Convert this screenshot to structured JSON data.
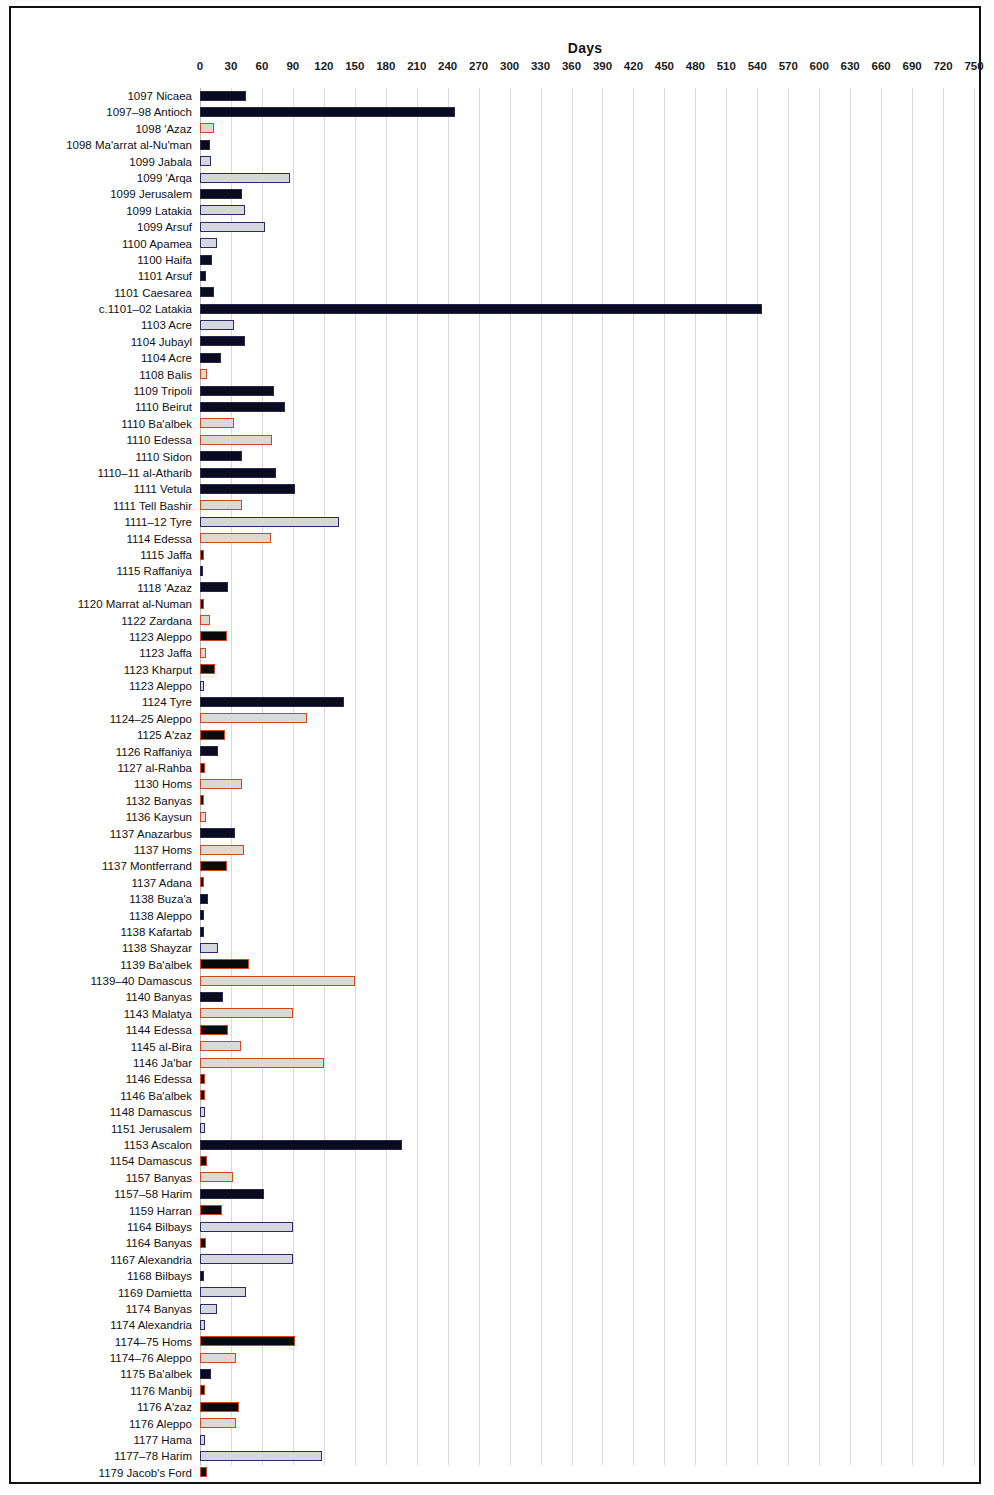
{
  "chart_data": {
    "type": "bar",
    "orientation": "horizontal",
    "title": "Days",
    "xlabel": "Days",
    "ylabel": "",
    "xlim": [
      0,
      750
    ],
    "xticks": [
      0,
      30,
      60,
      90,
      120,
      150,
      180,
      210,
      240,
      270,
      300,
      330,
      360,
      390,
      420,
      450,
      480,
      510,
      540,
      570,
      600,
      630,
      660,
      690,
      720,
      750
    ],
    "grid": true,
    "legend": "none",
    "styles": {
      "s-dark": {
        "fill": "#0b0b1f",
        "edge": "#272750"
      },
      "s-light": {
        "fill": "#d6d6de",
        "edge": "#2b2b63"
      },
      "s-lightred": {
        "fill": "#dcd9d2",
        "edge": "#d1471f"
      },
      "s-darkred": {
        "fill": "#0a0a0a",
        "edge": "#d1471f"
      }
    },
    "categories": [
      "1097 Nicaea",
      "1097–98 Antioch",
      "1098 'Azaz",
      "1098 Ma'arrat al-Nu'man",
      "1099 Jabala",
      "1099 'Arqa",
      "1099 Jerusalem",
      "1099 Latakia",
      "1099 Arsuf",
      "1100 Apamea",
      "1100 Haifa",
      "1101 Arsuf",
      "1101 Caesarea",
      "c.1101–02 Latakia",
      "1103 Acre",
      "1104 Jubayl",
      "1104 Acre",
      "1108 Balis",
      "1109 Tripoli",
      "1110 Beirut",
      "1110 Ba'albek",
      "1110 Edessa",
      "1110 Sidon",
      "1110–11 al-Atharib",
      "1111 Vetula",
      "1111 Tell Bashir",
      "1111–12 Tyre",
      "1114 Edessa",
      "1115 Jaffa",
      "1115 Raffaniya",
      "1118 'Azaz",
      "1120 Marrat al-Numan",
      "1122 Zardana",
      "1123 Aleppo",
      "1123 Jaffa",
      "1123 Kharput",
      "1123 Aleppo",
      "1124 Tyre",
      "1124–25 Aleppo",
      "1125 A'zaz",
      "1126 Raffaniya",
      "1127 al-Rahba",
      "1130 Homs",
      "1132 Banyas",
      "1136 Kaysun",
      "1137 Anazarbus",
      "1137 Homs",
      "1137 Montferrand",
      "1137 Adana",
      "1138 Buza'a",
      "1138 Aleppo",
      "1138 Kafartab",
      "1138 Shayzar",
      "1139 Ba'albek",
      "1139–40 Damascus",
      "1140 Banyas",
      "1143 Malatya",
      "1144 Edessa",
      "1145 al-Bira",
      "1146 Ja'bar",
      "1146 Edessa",
      "1146 Ba'albek",
      "1148 Damascus",
      "1151 Jerusalem",
      "1153 Ascalon",
      "1154 Damascus",
      "1157 Banyas",
      "1157–58 Harim",
      "1159 Harran",
      "1164 Bilbays",
      "1164 Banyas",
      "1167 Alexandria",
      "1168 Bilbays",
      "1169 Damietta",
      "1174 Banyas",
      "1174 Alexandria",
      "1174–75 Homs",
      "1174–76 Aleppo",
      "1175 Ba'albek",
      "1176 Manbij",
      "1176 A'zaz",
      "1176 Aleppo",
      "1177 Hama",
      "1177–78 Harim",
      "1179 Jacob's Ford"
    ],
    "values": [
      45,
      247,
      14,
      10,
      11,
      87,
      41,
      44,
      63,
      16,
      12,
      6,
      14,
      545,
      33,
      44,
      20,
      7,
      72,
      82,
      33,
      70,
      41,
      74,
      92,
      41,
      135,
      69,
      4,
      3,
      27,
      4,
      10,
      26,
      6,
      15,
      4,
      140,
      104,
      24,
      17,
      5,
      41,
      4,
      6,
      34,
      43,
      26,
      4,
      8,
      4,
      4,
      17,
      47,
      150,
      22,
      90,
      27,
      40,
      120,
      5,
      5,
      5,
      5,
      196,
      7,
      32,
      62,
      21,
      90,
      6,
      90,
      4,
      45,
      16,
      5,
      92,
      35,
      11,
      5,
      38,
      35,
      5,
      118,
      7
    ],
    "bar_styles": [
      "s-dark",
      "s-dark",
      "s-lightred",
      "s-dark",
      "s-light",
      "s-light",
      "s-dark",
      "s-light",
      "s-light",
      "s-light",
      "s-dark",
      "s-dark",
      "s-dark",
      "s-dark",
      "s-light",
      "s-dark",
      "s-dark",
      "s-lightred",
      "s-dark",
      "s-dark",
      "s-lightred",
      "s-lightred",
      "s-dark",
      "s-dark",
      "s-dark",
      "s-lightred",
      "s-light",
      "s-lightred",
      "s-darkred",
      "s-dark",
      "s-dark",
      "s-darkred",
      "s-lightred",
      "s-darkred",
      "s-lightred",
      "s-darkred",
      "s-light",
      "s-dark",
      "s-lightred",
      "s-darkred",
      "s-dark",
      "s-darkred",
      "s-lightred",
      "s-darkred",
      "s-lightred",
      "s-dark",
      "s-lightred",
      "s-darkred",
      "s-darkred",
      "s-dark",
      "s-dark",
      "s-dark",
      "s-light",
      "s-darkred",
      "s-lightred",
      "s-dark",
      "s-lightred",
      "s-darkred",
      "s-lightred",
      "s-lightred",
      "s-darkred",
      "s-darkred",
      "s-light",
      "s-light",
      "s-dark",
      "s-darkred",
      "s-lightred",
      "s-dark",
      "s-darkred",
      "s-light",
      "s-darkred",
      "s-light",
      "s-dark",
      "s-light",
      "s-light",
      "s-light",
      "s-darkred",
      "s-lightred",
      "s-dark",
      "s-darkred",
      "s-darkred",
      "s-lightred",
      "s-light",
      "s-light",
      "s-darkred"
    ]
  }
}
